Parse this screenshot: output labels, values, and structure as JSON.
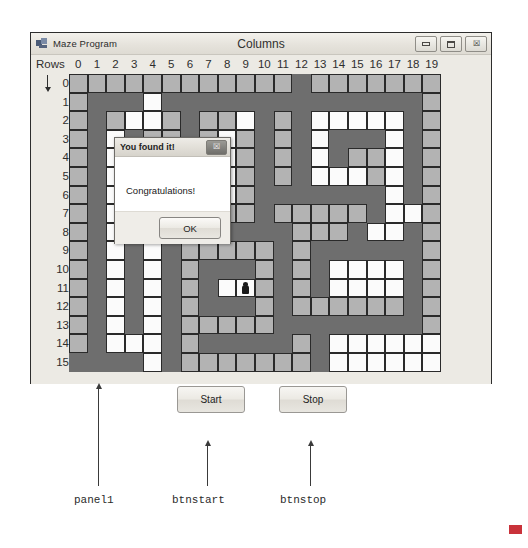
{
  "window": {
    "title": "Maze Program",
    "icon": "app-window-icon",
    "columns_caption": "Columns",
    "rows_caption": "Rows",
    "controls": [
      {
        "name": "minimize-button",
        "glyph": "minimize-icon"
      },
      {
        "name": "maximize-button",
        "glyph": "maximize-icon"
      },
      {
        "name": "close-button",
        "glyph": "close-icon",
        "label": "☒"
      }
    ]
  },
  "grid": {
    "column_labels": [
      "0",
      "1",
      "2",
      "3",
      "4",
      "5",
      "6",
      "7",
      "8",
      "9",
      "10",
      "11",
      "12",
      "13",
      "14",
      "15",
      "16",
      "17",
      "18",
      "19"
    ],
    "row_labels": [
      "0",
      "1",
      "2",
      "3",
      "4",
      "5",
      "6",
      "7",
      "8",
      "9",
      "10",
      "11",
      "12",
      "13",
      "14",
      "15"
    ],
    "cols": 20,
    "rows": 16,
    "cell_px": 18.6,
    "legend": {
      "path_color": "#b3b3b3",
      "open_color": "#fbfbfb",
      "wall_color": "#6e6e6e"
    },
    "player": {
      "col": 9,
      "row": 11,
      "icon": "player-sprite-icon"
    },
    "cells": [
      "PPPPPPPPPPPPWPPPPPPP",
      "PWWWOWWWWWWWWWWWWWWP",
      "PWPOOPWPPOWPWOOOOOWP",
      "PWOWPPWPOPWPWOWWWOWP",
      "PWOWPWWPOPWPWOWPPOWP",
      "PWOWPWPPOPWPWOOOPOWP",
      "PWOWPWPOOPWWWWWWWOWP",
      "PWOWWWWPPPWPPPPPWOOP",
      "PWOWOWWWWWWWPPPWOOWP",
      "PWOWOWPPPPPWPWWWWWWP",
      "PWOWOWPWWWPWPWOOOOWP",
      "PWOWOWPWAWPWPWOOOOWP",
      "PWOWOWPWWWPWPPPPPPWP",
      "PWOWOWPPPPPWWWWWWWWP",
      "PWOOOWPWWWWWPWOOOOOO",
      "WWWWOWPPPPPPPWOOOOOO"
    ]
  },
  "dialog": {
    "title": "You found it!",
    "message": "Congratulations!",
    "close_glyph": "☒",
    "ok_label": "OK"
  },
  "buttons": {
    "start_label": "Start",
    "stop_label": "Stop"
  },
  "annotations": [
    {
      "name": "annotation-panel1",
      "label": "panel1"
    },
    {
      "name": "annotation-btnstart",
      "label": "btnstart"
    },
    {
      "name": "annotation-btnstop",
      "label": "btnstop"
    }
  ]
}
